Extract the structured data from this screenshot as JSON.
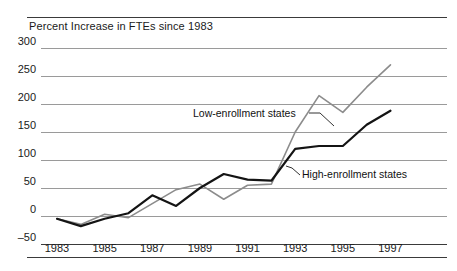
{
  "figure": {
    "name": "fte-percent-increase-line-chart"
  },
  "chart_data": {
    "type": "line",
    "title": "Percent Increase in FTEs since 1983",
    "xlabel": "",
    "ylabel": "",
    "grid": true,
    "legend_position": "inline-annotations",
    "x": [
      1983,
      1984,
      1985,
      1986,
      1987,
      1988,
      1989,
      1990,
      1991,
      1992,
      1993,
      1994,
      1995,
      1996,
      1997
    ],
    "xtick_labels": [
      "1983",
      "1985",
      "1987",
      "1989",
      "1991",
      "1993",
      "1995",
      "1997"
    ],
    "xtick_values": [
      1983,
      1985,
      1987,
      1989,
      1991,
      1993,
      1995,
      1997
    ],
    "xlim": [
      1983,
      1997
    ],
    "ytick_labels": [
      "300",
      "250",
      "200",
      "150",
      "100",
      "50",
      "0",
      "–50"
    ],
    "ytick_values": [
      300,
      250,
      200,
      150,
      100,
      50,
      0,
      -50
    ],
    "ylim": [
      -50,
      300
    ],
    "series": [
      {
        "name": "Low-enrollment states",
        "color": "#8c8c8c",
        "values": [
          -5,
          -15,
          3,
          -3,
          22,
          47,
          57,
          30,
          55,
          57,
          150,
          215,
          185,
          230,
          270
        ]
      },
      {
        "name": "High-enrollment states",
        "color": "#141414",
        "values": [
          -5,
          -18,
          -5,
          5,
          37,
          18,
          50,
          75,
          65,
          63,
          120,
          125,
          125,
          163,
          188
        ]
      }
    ],
    "annotations": [
      {
        "text": "Low-enrollment states",
        "series": "Low-enrollment states"
      },
      {
        "text": "High-enrollment states",
        "series": "High-enrollment states"
      }
    ]
  }
}
